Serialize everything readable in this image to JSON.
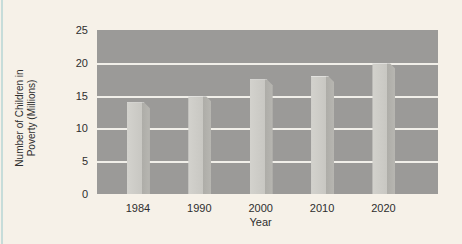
{
  "chart_data": {
    "type": "bar",
    "title": "",
    "categories": [
      "1984",
      "1990",
      "2000",
      "2010",
      "2020"
    ],
    "values": [
      14,
      15,
      17.5,
      18,
      20
    ],
    "xlabel": "Year",
    "ylabel": "Number of Children in Poverty (Millions)",
    "ylabel_lines": [
      "Number of Children in",
      "Poverty (Millions)"
    ],
    "ylim": [
      0,
      25
    ],
    "yticks": [
      0,
      5,
      10,
      15,
      20,
      25
    ],
    "grid": true,
    "legend": false,
    "layout_hints": {
      "gridlines_between_only": true,
      "bar_style": "3d-beveled",
      "xlabel_position": "under-middle-category"
    }
  },
  "colors": {
    "background": "#f6f1e8",
    "plot_background": "#9b9a98",
    "gridline": "#f1efe9",
    "bar_face_light": "#d3d2cd",
    "bar_face": "#c8c7c2",
    "bar_shade": "#aeada8",
    "bar_shade2": "#b7b6b1",
    "text": "#2e2e2e",
    "left_edge_stripe": "#c6dcd9"
  }
}
